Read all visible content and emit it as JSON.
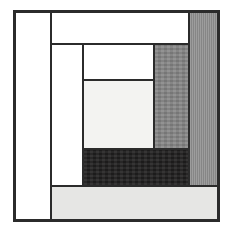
{
  "image": {
    "kind": "quilt-block-diagram",
    "pattern_name": "Log Cabin",
    "width": 232,
    "height": 233,
    "background": "#ffffff",
    "outline_color": "#2b2b2b"
  },
  "frame": {
    "x": 13,
    "y": 10,
    "width": 207,
    "height": 212,
    "border_color": "#2b2b2b",
    "border_width": 2
  },
  "patches": [
    {
      "id": "left-white-strip",
      "name": "left-white-strip",
      "label": "",
      "x": 0,
      "y": 0,
      "width": 36,
      "height": 208,
      "color": "#ffffff",
      "texture": "none",
      "outlined": true
    },
    {
      "id": "top-white-strip",
      "name": "top-white-strip",
      "label": "",
      "x": 36,
      "y": 0,
      "width": 138,
      "height": 32,
      "color": "#ffffff",
      "texture": "none",
      "outlined": true
    },
    {
      "id": "right-gray-strip",
      "name": "right-gray-strip",
      "label": "",
      "x": 174,
      "y": 0,
      "width": 29,
      "height": 174,
      "color": "#8d8d8d",
      "texture": "vertical-stripe",
      "outlined": true
    },
    {
      "id": "second-white-column",
      "name": "second-white-column",
      "label": "",
      "x": 36,
      "y": 32,
      "width": 32,
      "height": 142,
      "color": "#ffffff",
      "texture": "none",
      "outlined": true
    },
    {
      "id": "inner-white-patch",
      "name": "inner-white-patch",
      "label": "",
      "x": 68,
      "y": 32,
      "width": 71,
      "height": 36,
      "color": "#ffffff",
      "texture": "none",
      "outlined": true
    },
    {
      "id": "center-offwhite-patch",
      "name": "center-offwhite-patch",
      "label": "",
      "x": 68,
      "y": 68,
      "width": 71,
      "height": 69,
      "color": "#f3f3f1",
      "texture": "none",
      "outlined": true
    },
    {
      "id": "medium-gray-patch",
      "name": "medium-gray-patch",
      "label": "",
      "x": 139,
      "y": 32,
      "width": 35,
      "height": 105,
      "color": "#878787",
      "texture": "speckle",
      "outlined": true
    },
    {
      "id": "dark-bottom-patch",
      "name": "dark-bottom-patch",
      "label": "",
      "x": 68,
      "y": 137,
      "width": 106,
      "height": 37,
      "color": "#201f1f",
      "texture": "speckle",
      "outlined": true
    },
    {
      "id": "bottom-light-gray-strip",
      "name": "bottom-light-gray-strip",
      "label": "",
      "x": 36,
      "y": 174,
      "width": 167,
      "height": 34,
      "color": "#e6e6e4",
      "texture": "none",
      "outlined": true
    }
  ],
  "palette": {
    "white": "#ffffff",
    "off_white": "#f3f3f1",
    "light_gray": "#e6e6e4",
    "medium_gray": "#878787",
    "striped_gray": "#8d8d8d",
    "near_black": "#201f1f",
    "outline": "#2b2b2b"
  }
}
